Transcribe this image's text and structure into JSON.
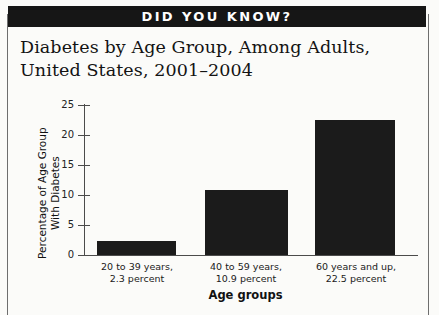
{
  "banner": {
    "text": "DID YOU KNOW?"
  },
  "title": {
    "line1": "Diabetes by Age Group, Among Adults,",
    "line2": "United States, 2001–2004"
  },
  "colors": {
    "banner_background": "#161616",
    "banner_text": "#ffffff",
    "bar_fill": "#1b1b1b",
    "axis": "#4b4b4b",
    "page_background": "#fbfbf9"
  },
  "chart_data": {
    "type": "bar",
    "title": "Diabetes by Age Group, Among Adults, United States, 2001–2004",
    "categories": [
      "20 to 39 years",
      "40 to 59 years",
      "60 years and up"
    ],
    "category_labels": [
      {
        "line1": "20 to 39 years,",
        "line2": "2.3 percent"
      },
      {
        "line1": "40 to 59 years,",
        "line2": "10.9 percent"
      },
      {
        "line1": "60 years and up,",
        "line2": "22.5 percent"
      }
    ],
    "values": [
      2.3,
      10.9,
      22.5
    ],
    "value_labels": [
      "2.3 percent",
      "10.9 percent",
      "22.5 percent"
    ],
    "xlabel": "Age groups",
    "ylabel_line1": "Percentage of Age Group",
    "ylabel_line2": "With Diabetes",
    "ylim": [
      0,
      25
    ],
    "yticks": [
      0,
      5,
      10,
      15,
      20,
      25
    ],
    "ytick_labels": [
      "0",
      "5",
      "10",
      "15",
      "20",
      "25"
    ],
    "grid": false,
    "legend": false
  }
}
